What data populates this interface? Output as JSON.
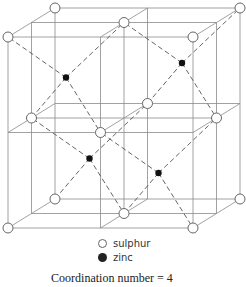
{
  "figure": {
    "legend": [
      {
        "label": "sulphur",
        "symbol": "open-circle"
      },
      {
        "label": "zinc",
        "symbol": "filled-circle"
      }
    ],
    "caption": "Coordination number = 4"
  },
  "lattice": {
    "sulphur_sites": [
      [
        0,
        0,
        0
      ],
      [
        1,
        0,
        0
      ],
      [
        0,
        1,
        0
      ],
      [
        1,
        1,
        0
      ],
      [
        0,
        0,
        1
      ],
      [
        1,
        0,
        1
      ],
      [
        0,
        1,
        1
      ],
      [
        1,
        1,
        1
      ],
      [
        0.5,
        0.5,
        0
      ],
      [
        0.5,
        0.5,
        1
      ],
      [
        0,
        0.5,
        0.5
      ],
      [
        1,
        0.5,
        0.5
      ],
      [
        0.5,
        0,
        0.5
      ],
      [
        0.5,
        1,
        0.5
      ]
    ],
    "zinc_sites": [
      [
        0.25,
        0.75,
        0.25
      ],
      [
        0.75,
        0.75,
        0.75
      ],
      [
        0.25,
        0.25,
        0.75
      ],
      [
        0.75,
        0.25,
        0.25
      ]
    ],
    "colors": {
      "line": "#8a8a8a",
      "bond": "#555555",
      "zinc": "#111111",
      "sulphur_fill": "#ffffff",
      "sulphur_stroke": "#666666"
    }
  }
}
